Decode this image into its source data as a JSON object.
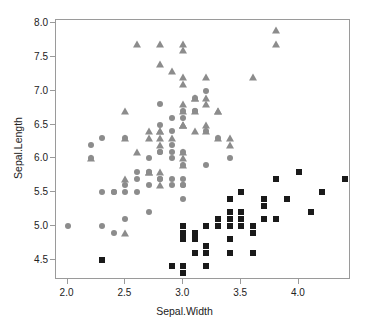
{
  "chart_data": {
    "type": "scatter",
    "title": "",
    "xlabel": "Sepal.Width",
    "ylabel": "Sepal.Length",
    "xlim": [
      1.9,
      4.45
    ],
    "ylim": [
      4.2,
      8.05
    ],
    "xticks": [
      "2.0",
      "2.5",
      "3.0",
      "3.5",
      "4.0"
    ],
    "xtick_values": [
      2.0,
      2.5,
      3.0,
      3.5,
      4.0
    ],
    "yticks": [
      "4.5",
      "5.0",
      "5.5",
      "6.0",
      "6.5",
      "7.0",
      "7.5",
      "8.0"
    ],
    "ytick_values": [
      4.5,
      5.0,
      5.5,
      6.0,
      6.5,
      7.0,
      7.5,
      8.0
    ],
    "grid": false,
    "legend": "none",
    "colors": {
      "setosa": "#1a1a1a",
      "versicolor": "#8c8c8c",
      "virginica": "#8c8c8c",
      "axis": "#9a9a9a",
      "text": "#222222",
      "background": "#ffffff"
    },
    "series": [
      {
        "name": "setosa",
        "marker": "square",
        "color": "#1a1a1a",
        "x": [
          3.5,
          3.0,
          3.2,
          3.1,
          3.6,
          3.9,
          3.4,
          3.4,
          2.9,
          3.1,
          3.7,
          3.4,
          3.0,
          3.0,
          4.0,
          4.4,
          3.9,
          3.5,
          3.8,
          3.8,
          3.4,
          3.7,
          3.6,
          3.3,
          3.4,
          3.0,
          3.4,
          3.5,
          3.4,
          3.2,
          3.1,
          3.4,
          4.1,
          4.2,
          3.1,
          3.2,
          3.5,
          3.6,
          3.0,
          3.4,
          3.5,
          2.3,
          3.2,
          3.5,
          3.8,
          3.0,
          3.8,
          3.2,
          3.7,
          3.3
        ],
        "y": [
          5.1,
          4.9,
          4.7,
          4.6,
          5.0,
          5.4,
          4.6,
          5.0,
          4.4,
          4.9,
          5.4,
          4.8,
          4.8,
          4.3,
          5.8,
          5.7,
          5.4,
          5.1,
          5.7,
          5.1,
          5.4,
          5.1,
          4.6,
          5.1,
          4.8,
          5.0,
          5.0,
          5.2,
          5.2,
          4.7,
          4.8,
          5.4,
          5.2,
          5.5,
          4.9,
          5.0,
          5.5,
          4.9,
          4.4,
          5.1,
          5.0,
          4.5,
          4.4,
          5.0,
          5.1,
          4.8,
          5.1,
          4.6,
          5.3,
          5.0
        ]
      },
      {
        "name": "versicolor",
        "marker": "circle",
        "color": "#8c8c8c",
        "x": [
          3.2,
          3.2,
          3.1,
          2.3,
          2.8,
          2.8,
          3.3,
          2.4,
          2.9,
          2.7,
          2.0,
          3.0,
          2.2,
          2.9,
          2.9,
          3.1,
          3.0,
          2.7,
          2.2,
          2.5,
          3.2,
          2.8,
          2.5,
          2.8,
          2.9,
          3.0,
          2.8,
          3.0,
          2.9,
          2.6,
          2.4,
          2.4,
          2.7,
          2.7,
          3.0,
          3.4,
          3.1,
          2.3,
          3.0,
          2.5,
          2.6,
          3.0,
          2.6,
          2.3,
          2.7,
          3.0,
          2.9,
          2.9,
          2.5,
          2.8
        ],
        "y": [
          7.0,
          6.4,
          6.9,
          5.5,
          6.5,
          5.7,
          6.3,
          4.9,
          6.6,
          5.2,
          5.0,
          5.9,
          6.0,
          6.1,
          5.6,
          6.7,
          5.6,
          5.8,
          6.2,
          5.6,
          5.9,
          6.1,
          6.3,
          6.1,
          6.4,
          6.6,
          6.8,
          6.7,
          6.0,
          5.7,
          5.5,
          5.5,
          5.8,
          6.0,
          5.4,
          6.0,
          6.7,
          6.3,
          5.6,
          5.5,
          5.5,
          6.1,
          5.8,
          5.0,
          5.6,
          5.7,
          5.7,
          6.2,
          5.1,
          5.7
        ]
      },
      {
        "name": "virginica",
        "marker": "triangle",
        "color": "#8c8c8c",
        "x": [
          3.3,
          2.7,
          3.0,
          2.9,
          3.0,
          3.0,
          2.5,
          2.9,
          2.5,
          3.6,
          3.2,
          2.7,
          3.0,
          2.5,
          2.8,
          3.2,
          3.0,
          3.8,
          2.6,
          2.2,
          3.2,
          2.8,
          2.8,
          2.7,
          3.3,
          3.2,
          2.8,
          3.0,
          2.8,
          3.0,
          2.8,
          3.8,
          2.8,
          2.8,
          2.6,
          3.0,
          3.4,
          3.1,
          3.0,
          3.1,
          3.1,
          3.1,
          2.7,
          3.2,
          3.3,
          3.0,
          2.5,
          3.0,
          3.4,
          3.0
        ],
        "y": [
          6.3,
          5.8,
          7.1,
          6.3,
          6.5,
          7.6,
          4.9,
          7.3,
          6.7,
          7.2,
          6.5,
          6.4,
          6.8,
          5.7,
          5.8,
          6.4,
          6.5,
          7.7,
          7.7,
          6.0,
          6.9,
          5.6,
          7.7,
          6.3,
          6.7,
          7.2,
          6.2,
          6.1,
          6.4,
          7.2,
          7.4,
          7.9,
          6.4,
          6.3,
          6.1,
          7.7,
          6.3,
          6.4,
          6.0,
          6.9,
          6.7,
          6.9,
          5.8,
          6.8,
          6.7,
          6.7,
          6.3,
          6.5,
          6.2,
          5.9
        ]
      }
    ]
  }
}
